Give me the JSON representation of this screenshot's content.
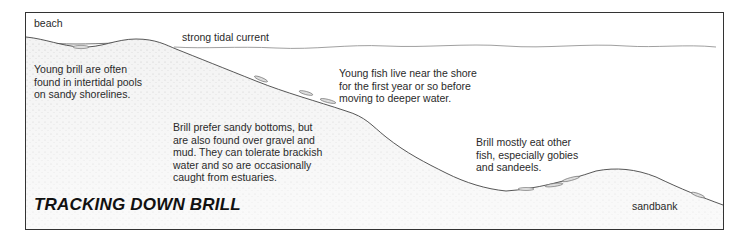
{
  "title": "TRACKING DOWN BRILL",
  "labels": {
    "beach": "beach",
    "current": "strong tidal current",
    "sandbank": "sandbank"
  },
  "notes": {
    "young_brill": [
      "Young brill are often",
      "found in intertidal pools",
      "on sandy shorelines."
    ],
    "young_fish": [
      "Young fish live near the shore",
      "for the first year or so before",
      "moving to deeper water."
    ],
    "habitat": [
      "Brill prefer sandy bottoms, but",
      "are also found over gravel and",
      "mud. They can tolerate brackish",
      "water and so are occasionally",
      "caught from estuaries."
    ],
    "diet": [
      "Brill mostly eat other",
      "fish, especially gobies",
      "and  sandeels."
    ]
  },
  "colors": {
    "border": "#333333",
    "water_line": "#888888",
    "seabed_line": "#444444",
    "sand_fill": "#efefef"
  }
}
